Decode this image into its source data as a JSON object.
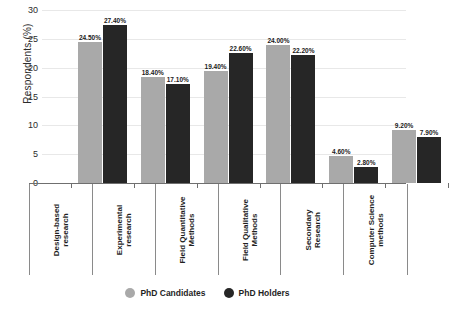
{
  "chart_data": {
    "type": "bar",
    "title": "",
    "xlabel": "",
    "ylabel": "Respondents (%)",
    "ylim": [
      0,
      30
    ],
    "ytick_step": 5,
    "yticks": [
      "30",
      "25",
      "20",
      "15",
      "10",
      "5",
      "0"
    ],
    "grid": true,
    "legend_position": "bottom",
    "categories": [
      "Design-based\nresearch",
      "Experimental\nresearch",
      "Field Quantitative\nMethods",
      "Field Qualitative\nMethods",
      "Secondary\nResearch",
      "Computer Science\nmethods"
    ],
    "series": [
      {
        "name": "PhD Candidates",
        "color": "#a9a9a9",
        "values": [
          24.5,
          18.4,
          19.4,
          24.0,
          4.6,
          9.2
        ],
        "labels": [
          "24.50%",
          "18.40%",
          "19.40%",
          "24.00%",
          "4.60%",
          "9.20%"
        ]
      },
      {
        "name": "PhD Holders",
        "color": "#262626",
        "values": [
          27.4,
          17.1,
          22.6,
          22.2,
          2.8,
          7.9
        ],
        "labels": [
          "27.40%",
          "17.10%",
          "22.60%",
          "22.20%",
          "2.80%",
          "7.90%"
        ]
      }
    ]
  },
  "legend": {
    "items": [
      {
        "label": "PhD Candidates",
        "color": "#a9a9a9",
        "marker": "circle-marker"
      },
      {
        "label": "PhD Holders",
        "color": "#262626",
        "marker": "circle-marker"
      }
    ]
  }
}
